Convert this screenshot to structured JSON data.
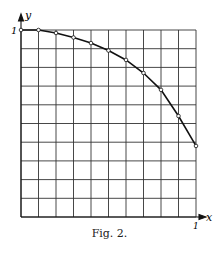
{
  "figure": {
    "caption": "Fig. 2.",
    "y_axis_label": "y",
    "x_axis_label": "x",
    "y_tick_label": "1",
    "x_tick_label": "1"
  },
  "chart_data": {
    "type": "line",
    "title": "",
    "caption": "Fig. 2.",
    "xlabel": "x",
    "ylabel": "y",
    "xlim": [
      0,
      1
    ],
    "ylim": [
      0,
      1
    ],
    "grid": true,
    "grid_divisions": {
      "x": 10,
      "y": 10
    },
    "tick_labels": {
      "x": [
        "1"
      ],
      "y": [
        "1"
      ]
    },
    "series": [
      {
        "name": "curve",
        "markers": "open-circle",
        "x": [
          0,
          0.1,
          0.2,
          0.3,
          0.4,
          0.5,
          0.6,
          0.7,
          0.8,
          0.9,
          1.0
        ],
        "y": [
          1.0,
          1.0,
          0.984,
          0.96,
          0.93,
          0.89,
          0.84,
          0.77,
          0.68,
          0.54,
          0.38
        ]
      }
    ]
  }
}
